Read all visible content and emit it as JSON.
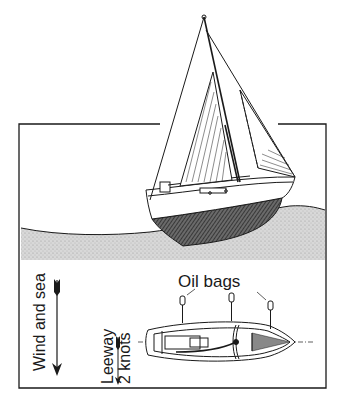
{
  "figure": {
    "labels": {
      "oil_bags": "Oil bags",
      "wind_and_sea": "Wind and sea",
      "leeway_line1": "Leeway",
      "leeway_line2": "2 knots"
    },
    "panels": [
      {
        "name": "side-view",
        "description": "Sloop heeled on the sea surface, hull below waterline hatched"
      },
      {
        "name": "plan-view",
        "description": "Boat from above with three oil bags hanging on the windward side"
      }
    ],
    "oil_bag_count": 3,
    "colors": {
      "ink": "#1a1a1a",
      "sea": "#d4d4d4",
      "background": "#ffffff"
    }
  }
}
